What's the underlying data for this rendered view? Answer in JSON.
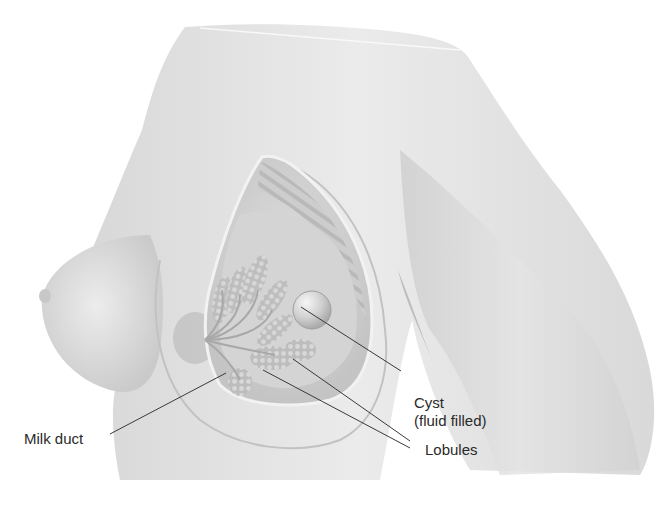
{
  "figure": {
    "colors": {
      "background": "#ffffff",
      "skin": "#e6e6e6",
      "skin_shadow": "#c8c8c8",
      "tissue": "#cfcfcf",
      "lobule": "#bdbdbd",
      "leader_line": "#3a3a3a",
      "label_text": "#2a2a2a"
    },
    "labels": {
      "cyst_line1": "Cyst",
      "cyst_line2": "(fluid filled)",
      "lobules": "Lobules",
      "milk_duct": "Milk duct"
    }
  }
}
